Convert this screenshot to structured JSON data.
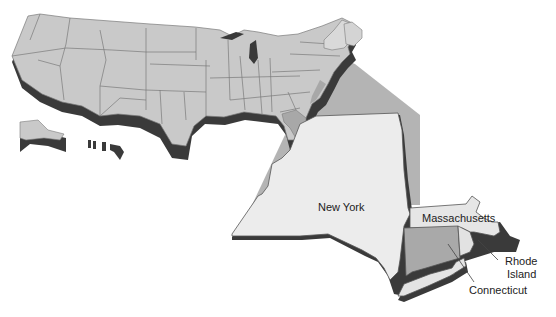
{
  "map": {
    "title": "",
    "colors": {
      "us_fill": "#c9c9c9",
      "state_line": "#7a7a7a",
      "shadow": "#3a3a3a",
      "callout_fan": "#b4b4b4",
      "highlight_ne": "#a8a8a8",
      "new_york_fill": "#ececec",
      "massachusetts_fill": "#e6e6e6",
      "connecticut_fill": "#a9a9a9",
      "rhode_island_fill": "#e2e2e2",
      "long_island_fill": "#e4e4e4",
      "background": "#ffffff"
    },
    "labels": {
      "new_york": "New York",
      "massachusetts": "Massachusetts",
      "rhode_island_line1": "Rhode",
      "rhode_island_line2": "Island",
      "connecticut": "Connecticut"
    }
  }
}
